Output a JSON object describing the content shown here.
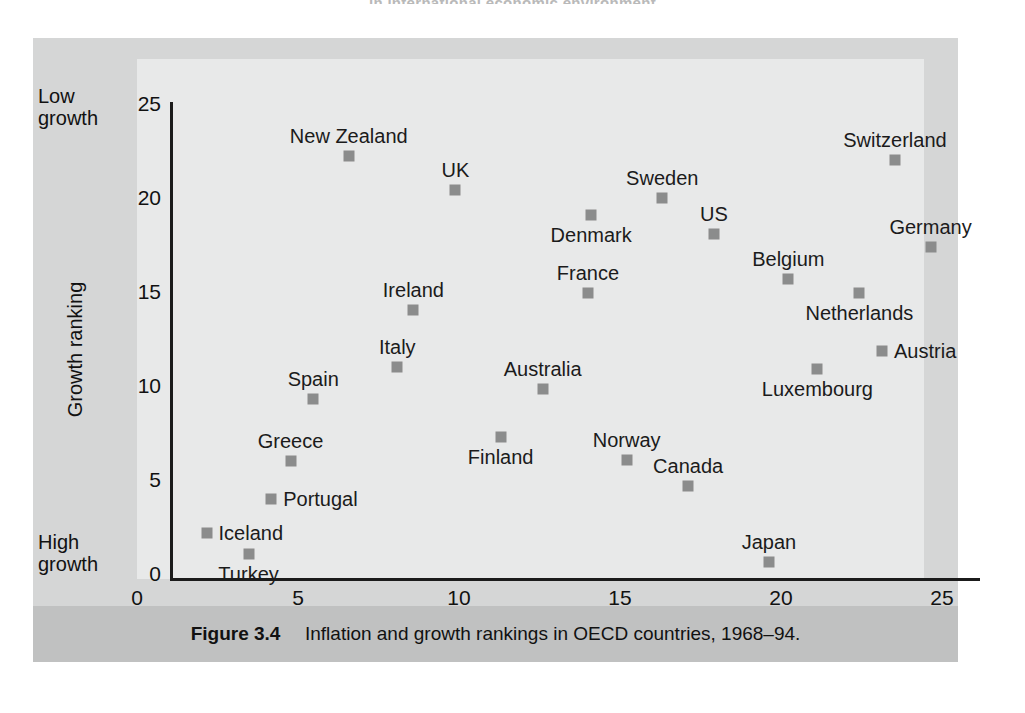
{
  "running_head": "in international economic environment",
  "caption": {
    "figure_number": "Figure 3.4",
    "text": "Inflation and growth rankings in OECD countries, 1968–94."
  },
  "axes": {
    "x_title": "Inflation ranking",
    "y_title": "Growth ranking",
    "x_left_note": "High inflation",
    "x_right_note": "Low inflation",
    "y_top_note_line1": "Low",
    "y_top_note_line2": "growth",
    "y_bottom_note_line1": "High",
    "y_bottom_note_line2": "growth",
    "x_ticks": [
      "0",
      "5",
      "10",
      "15",
      "20",
      "25"
    ],
    "y_ticks": [
      "0",
      "5",
      "10",
      "15",
      "20",
      "25"
    ]
  },
  "style": {
    "marker_color": "#8b8c8c",
    "panel_color": "#d5d6d6",
    "plot_field_color": "#e8e9e9",
    "caption_band_color": "#c0c1c1",
    "axis_color": "#1b1b1b"
  },
  "chart_data": {
    "type": "scatter",
    "xlabel": "Inflation ranking",
    "ylabel": "Growth ranking",
    "xlim": [
      0,
      25
    ],
    "ylim": [
      0,
      25
    ],
    "grid": false,
    "legend": "none",
    "annotations": {
      "x_axis_low_end": "High inflation",
      "x_axis_high_end": "Low inflation",
      "y_axis_low_end": "High growth",
      "y_axis_high_end": "Low growth"
    },
    "points": [
      {
        "label": "New Zealand",
        "x": 5.5,
        "y": 22.3,
        "label_pos": "above"
      },
      {
        "label": "Switzerland",
        "x": 22.4,
        "y": 22.1,
        "label_pos": "above"
      },
      {
        "label": "UK",
        "x": 8.8,
        "y": 20.5,
        "label_pos": "above"
      },
      {
        "label": "Sweden",
        "x": 15.2,
        "y": 20.1,
        "label_pos": "above"
      },
      {
        "label": "Denmark",
        "x": 13.0,
        "y": 19.2,
        "label_pos": "below"
      },
      {
        "label": "US",
        "x": 16.8,
        "y": 18.2,
        "label_pos": "above"
      },
      {
        "label": "Germany",
        "x": 23.5,
        "y": 17.5,
        "label_pos": "above"
      },
      {
        "label": "Belgium",
        "x": 19.1,
        "y": 15.8,
        "label_pos": "above"
      },
      {
        "label": "France",
        "x": 12.9,
        "y": 15.1,
        "label_pos": "above"
      },
      {
        "label": "Netherlands",
        "x": 21.3,
        "y": 15.1,
        "label_pos": "below"
      },
      {
        "label": "Ireland",
        "x": 7.5,
        "y": 14.2,
        "label_pos": "above"
      },
      {
        "label": "Austria",
        "x": 22.0,
        "y": 12.0,
        "label_pos": "right"
      },
      {
        "label": "Italy",
        "x": 7.0,
        "y": 11.2,
        "label_pos": "above"
      },
      {
        "label": "Luxembourg",
        "x": 20.0,
        "y": 11.1,
        "label_pos": "below"
      },
      {
        "label": "Australia",
        "x": 11.5,
        "y": 10.0,
        "label_pos": "above"
      },
      {
        "label": "Spain",
        "x": 4.4,
        "y": 9.5,
        "label_pos": "above"
      },
      {
        "label": "Finland",
        "x": 10.2,
        "y": 7.5,
        "label_pos": "below"
      },
      {
        "label": "Norway",
        "x": 14.1,
        "y": 6.3,
        "label_pos": "above"
      },
      {
        "label": "Greece",
        "x": 3.7,
        "y": 6.2,
        "label_pos": "above"
      },
      {
        "label": "Canada",
        "x": 16.0,
        "y": 4.9,
        "label_pos": "above"
      },
      {
        "label": "Portugal",
        "x": 3.1,
        "y": 4.2,
        "label_pos": "right"
      },
      {
        "label": "Iceland",
        "x": 1.1,
        "y": 2.4,
        "label_pos": "right"
      },
      {
        "label": "Turkey",
        "x": 2.4,
        "y": 1.3,
        "label_pos": "below"
      },
      {
        "label": "Japan",
        "x": 18.5,
        "y": 0.9,
        "label_pos": "above"
      }
    ]
  }
}
